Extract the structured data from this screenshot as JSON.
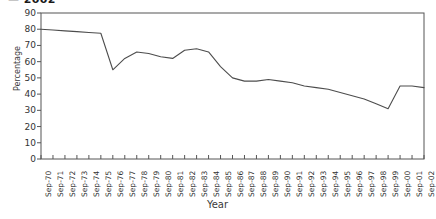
{
  "title_fragment": "— 2002",
  "axes": {
    "ylabel": "Percentage",
    "xlabel": "Year",
    "yticks": [
      0,
      10,
      20,
      30,
      40,
      50,
      60,
      70,
      80,
      90
    ],
    "ylim": [
      0,
      90
    ],
    "line_color": "#4d4d4d",
    "frame_color": "#555555"
  },
  "chart_data": {
    "type": "line",
    "title": "",
    "xlabel": "Year",
    "ylabel": "Percentage",
    "ylim": [
      0,
      90
    ],
    "grid": false,
    "legend": "none",
    "categories": [
      "Sep-70",
      "Sep-71",
      "Sep-72",
      "Sep-73",
      "Sep-74",
      "Sep-75",
      "Sep-76",
      "Sep-77",
      "Sep-78",
      "Sep-79",
      "Sep-80",
      "Sep-81",
      "Sep-82",
      "Sep-83",
      "Sep-84",
      "Sep-85",
      "Sep-86",
      "Sep-87",
      "Sep-88",
      "Sep-89",
      "Sep-90",
      "Sep-91",
      "Sep-92",
      "Sep-93",
      "Sep-94",
      "Sep-95",
      "Sep-96",
      "Sep-97",
      "Sep-98",
      "Sep-99",
      "Sep-00",
      "Sep-01",
      "Sep-02"
    ],
    "values": [
      80,
      79.5,
      79,
      78.5,
      78,
      77.5,
      55,
      62,
      66,
      65,
      63,
      62,
      67,
      68,
      66,
      57,
      50,
      48,
      48,
      49,
      48,
      47,
      45,
      44,
      43,
      41,
      39,
      37,
      34,
      31,
      45,
      45,
      44
    ]
  }
}
